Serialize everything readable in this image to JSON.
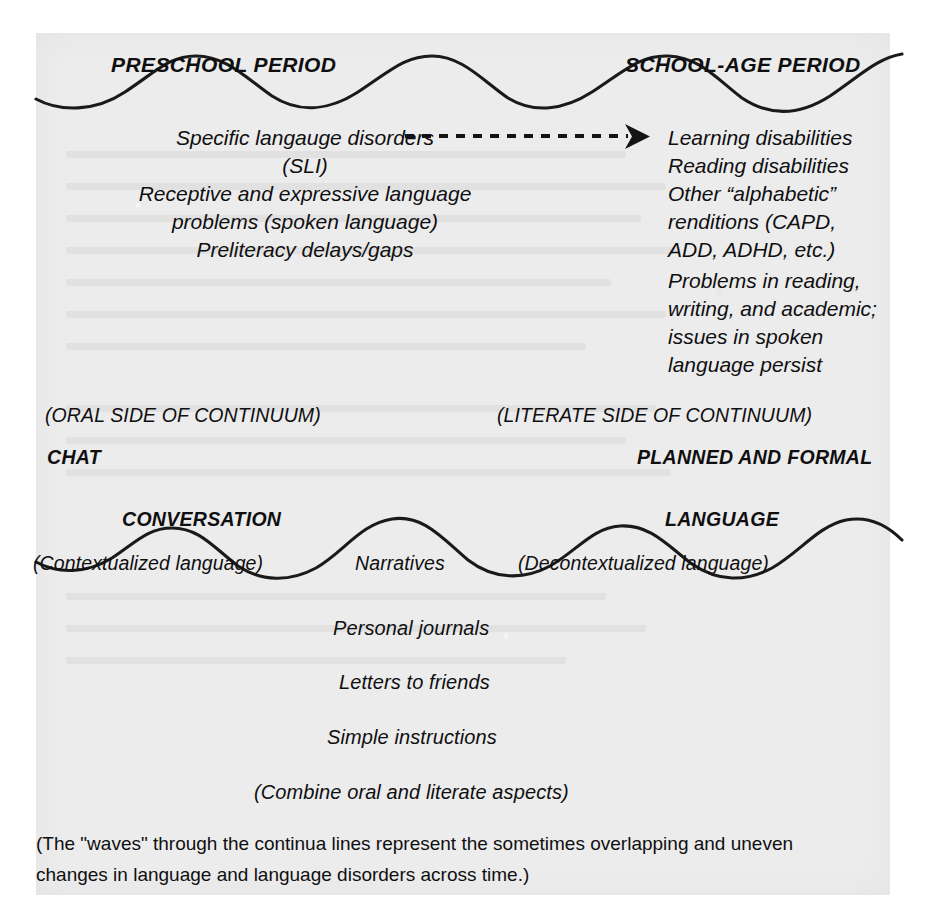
{
  "figure": {
    "background_color": "#ececed",
    "ink_color": "#100f10"
  },
  "top_wave": {
    "left_heading": "PRESCHOOL PERIOD",
    "right_heading": "SCHOOL-AGE PERIOD"
  },
  "preschool_column": {
    "lines": [
      "Specific langauge disorders",
      "(SLI)",
      "Receptive and expressive language",
      "problems (spoken language)",
      "Preliteracy delays/gaps"
    ]
  },
  "transition_arrow": {
    "style": "dashed-arrow-right",
    "label": ""
  },
  "school_age_column": {
    "group_one": [
      "Learning disabilities",
      "Reading disabilities",
      "Other “alphabetic”",
      "renditions (CAPD,",
      "ADD, ADHD, etc.)"
    ],
    "group_two": [
      "Problems in reading,",
      "writing, and academic;",
      "issues in spoken",
      "language persist"
    ]
  },
  "continuum_sides": {
    "oral_label": "(ORAL SIDE OF CONTINUUM)",
    "oral_mode": "CHAT",
    "literate_label": "(LITERATE SIDE OF CONTINUUM)",
    "literate_mode": "PLANNED AND FORMAL"
  },
  "bottom_wave": {
    "left_heading": "CONVERSATION",
    "left_sub": "(Contextualized language)",
    "middle_label": "Narratives",
    "right_heading": "LANGUAGE",
    "right_sub": "(Decontextualized language)"
  },
  "middle_examples": {
    "items": [
      "Personal journals",
      "Letters to friends",
      "Simple instructions"
    ],
    "summary": "(Combine oral and literate aspects)"
  },
  "footnote": {
    "line1": "(The \"waves\" through the continua lines represent the sometimes overlapping and uneven",
    "line2": "changes in language and language disorders across time.)"
  }
}
